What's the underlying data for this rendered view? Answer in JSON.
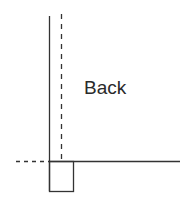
{
  "diagram": {
    "labels": {
      "back": "Back"
    },
    "colors": {
      "line": "#333333",
      "background": "#ffffff"
    },
    "elements": [
      {
        "type": "solid-vertical-line",
        "x": 49,
        "y1": 16,
        "y2": 191
      },
      {
        "type": "dashed-vertical-line",
        "x": 61,
        "y1": 14,
        "y2": 161
      },
      {
        "type": "solid-horizontal-line",
        "y": 161,
        "x1": 49,
        "x2": 180
      },
      {
        "type": "dashed-horizontal-line",
        "y": 161,
        "x1": 16,
        "x2": 49
      },
      {
        "type": "rectangle",
        "x": 49,
        "y": 161,
        "width": 24,
        "height": 30
      }
    ]
  }
}
